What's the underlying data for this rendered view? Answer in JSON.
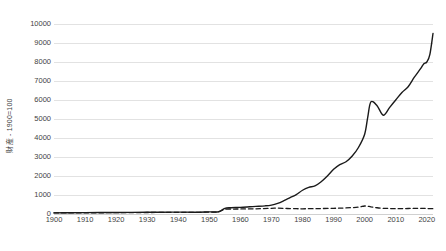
{
  "chart_data": {
    "type": "line",
    "title": "",
    "xlabel": "",
    "ylabel": "財産 - 1900=100",
    "xlim": [
      1900,
      2022
    ],
    "ylim": [
      0,
      10000
    ],
    "ytick_values": [
      0,
      1000,
      2000,
      3000,
      4000,
      5000,
      6000,
      7000,
      8000,
      9000,
      10000
    ],
    "ytick_labels": [
      "0",
      "1000",
      "2000",
      "3000",
      "4000",
      "5000",
      "6000",
      "7000",
      "8000",
      "9000",
      "10000"
    ],
    "xtick_values": [
      1900,
      1910,
      1920,
      1930,
      1940,
      1950,
      1960,
      1970,
      1980,
      1990,
      2000,
      2010,
      2020
    ],
    "xtick_labels": [
      "1900",
      "1910",
      "1920",
      "1930",
      "1940",
      "1950",
      "1960",
      "1970",
      "1980",
      "1990",
      "2000",
      "2010",
      "2020"
    ],
    "grid": true,
    "legend": "none",
    "series": [
      {
        "name": "solid-series",
        "style": "solid",
        "color": "#1a1a1a",
        "x": [
          1900,
          1905,
          1910,
          1915,
          1920,
          1925,
          1930,
          1935,
          1940,
          1945,
          1950,
          1953,
          1955,
          1957,
          1960,
          1963,
          1965,
          1968,
          1970,
          1972,
          1974,
          1976,
          1978,
          1980,
          1982,
          1984,
          1986,
          1988,
          1990,
          1992,
          1994,
          1996,
          1998,
          2000,
          2001,
          2002,
          2004,
          2006,
          2008,
          2010,
          2012,
          2014,
          2016,
          2018,
          2019,
          2020,
          2021,
          2022
        ],
        "values": [
          60,
          65,
          70,
          75,
          80,
          85,
          90,
          95,
          100,
          95,
          110,
          120,
          300,
          330,
          350,
          380,
          400,
          430,
          470,
          560,
          700,
          860,
          1020,
          1250,
          1400,
          1480,
          1700,
          2000,
          2350,
          2600,
          2750,
          3050,
          3500,
          4200,
          5100,
          5900,
          5700,
          5200,
          5600,
          6000,
          6400,
          6700,
          7200,
          7650,
          7900,
          8000,
          8400,
          9500
        ]
      },
      {
        "name": "dashed-series",
        "style": "dashed",
        "color": "#1a1a1a",
        "x": [
          1900,
          1910,
          1920,
          1930,
          1940,
          1945,
          1950,
          1953,
          1955,
          1958,
          1960,
          1965,
          1970,
          1972,
          1975,
          1978,
          1980,
          1985,
          1990,
          1994,
          1998,
          2000,
          2002,
          2004,
          2006,
          2008,
          2010,
          2012,
          2014,
          2016,
          2018,
          2020,
          2022
        ],
        "values": [
          55,
          62,
          70,
          78,
          88,
          85,
          100,
          115,
          250,
          260,
          265,
          275,
          300,
          310,
          290,
          280,
          275,
          285,
          300,
          320,
          360,
          420,
          380,
          330,
          300,
          290,
          280,
          285,
          290,
          295,
          300,
          290,
          280
        ]
      }
    ]
  }
}
